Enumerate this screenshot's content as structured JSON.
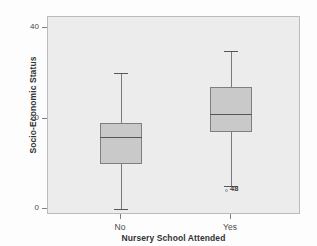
{
  "chart_data": {
    "type": "box",
    "title": "",
    "xlabel": "Nursery School Attended",
    "ylabel": "Socio-Economic Status",
    "categories": [
      "No",
      "Yes"
    ],
    "ylim": [
      0,
      42
    ],
    "yticks": [
      0,
      20,
      40
    ],
    "ytick_labels": [
      "0",
      "20",
      "40"
    ],
    "grid": false,
    "legend": "none",
    "series": [
      {
        "name": "No",
        "whisker_low": 0,
        "q1": 10,
        "median": 16,
        "q3": 19,
        "whisker_high": 30,
        "outliers": []
      },
      {
        "name": "Yes",
        "whisker_low": 5,
        "q1": 17,
        "median": 21,
        "q3": 27,
        "whisker_high": 35,
        "outliers": [
          {
            "value": 4,
            "case_label": "48"
          }
        ]
      }
    ]
  },
  "axes": {
    "y_tick_0": "0",
    "y_tick_1": "20",
    "y_tick_2": "40",
    "x_tick_0": "No",
    "x_tick_1": "Yes",
    "y_title": "Socio-Economic Status",
    "x_title": "Nursery School Attended"
  },
  "annotations": {
    "outlier_case_label": "48"
  },
  "colors": {
    "plot_background": "#ececed",
    "page_background": "#fdfdfd",
    "box_fill": "#c9c9c9",
    "box_border": "#7d7f81",
    "median_line": "#55565a",
    "whisker": "#77797c",
    "frame": "#b9bbbd",
    "text": "#3a3a3a"
  }
}
